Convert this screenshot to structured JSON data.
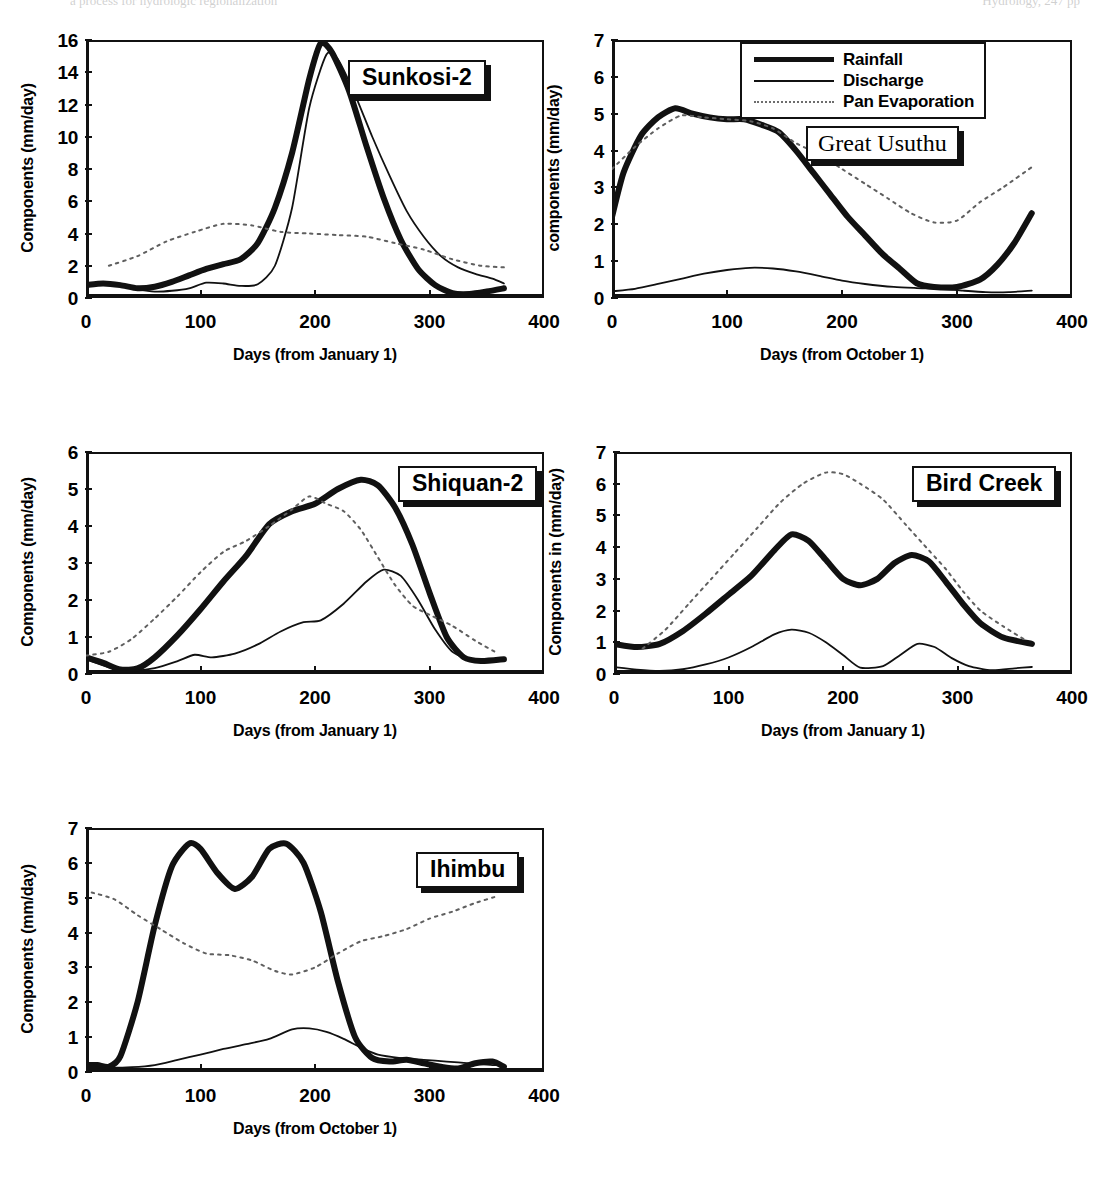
{
  "page": {
    "top_strip_left": "a process for hydrologic regionalization",
    "top_strip_right": "Hydrology, 247 pp"
  },
  "legend": {
    "position": "top-center-of-great-usuthu-panel",
    "entries": [
      {
        "label": "Rainfall",
        "style": "thick-solid",
        "color": "#111111"
      },
      {
        "label": "Discharge",
        "style": "thin-solid",
        "color": "#111111"
      },
      {
        "label": "Pan Evaporation",
        "style": "dotted",
        "color": "#6d6d6d"
      }
    ]
  },
  "chart_data": [
    {
      "id": "sunkosi-2",
      "type": "line",
      "title": "Sunkosi-2",
      "title_font": "sans",
      "xlabel": "Days (from January 1)",
      "ylabel": "Components (mm/day)",
      "xlim": [
        0,
        400
      ],
      "ylim": [
        0,
        16
      ],
      "xticks": [
        0,
        100,
        200,
        300,
        400
      ],
      "yticks": [
        0,
        2,
        4,
        6,
        8,
        10,
        12,
        14,
        16
      ],
      "grid": false,
      "series": [
        {
          "name": "Rainfall",
          "style": "thick-solid",
          "x": [
            0,
            15,
            30,
            45,
            60,
            75,
            90,
            105,
            120,
            135,
            150,
            165,
            180,
            195,
            205,
            215,
            230,
            245,
            260,
            275,
            290,
            305,
            320,
            335,
            350,
            365
          ],
          "y": [
            0.8,
            0.9,
            0.8,
            0.6,
            0.7,
            1.0,
            1.4,
            1.8,
            2.1,
            2.4,
            3.4,
            5.6,
            9.0,
            13.6,
            15.8,
            15.2,
            12.8,
            9.4,
            6.2,
            3.6,
            1.8,
            0.8,
            0.3,
            0.25,
            0.4,
            0.6
          ]
        },
        {
          "name": "Discharge",
          "style": "thin-solid",
          "x": [
            0,
            15,
            30,
            45,
            60,
            75,
            90,
            105,
            120,
            135,
            150,
            165,
            180,
            195,
            210,
            220,
            235,
            250,
            265,
            280,
            295,
            310,
            325,
            340,
            355,
            365
          ],
          "y": [
            0.7,
            0.85,
            0.8,
            0.55,
            0.4,
            0.45,
            0.6,
            0.95,
            0.9,
            0.75,
            0.85,
            2.0,
            5.6,
            11.8,
            15.1,
            14.8,
            12.6,
            10.0,
            7.6,
            5.4,
            3.8,
            2.6,
            1.9,
            1.5,
            1.2,
            0.9
          ]
        },
        {
          "name": "Pan Evaporation",
          "style": "dotted",
          "x": [
            20,
            45,
            70,
            95,
            120,
            145,
            170,
            195,
            220,
            245,
            270,
            295,
            320,
            345,
            365
          ],
          "y": [
            2.0,
            2.6,
            3.5,
            4.1,
            4.6,
            4.5,
            4.1,
            4.0,
            3.9,
            3.8,
            3.4,
            3.0,
            2.4,
            2.0,
            1.9
          ]
        }
      ]
    },
    {
      "id": "great-usuthu",
      "type": "line",
      "title": "Great Usuthu",
      "title_font": "serif",
      "xlabel": "Days (from October 1)",
      "ylabel": "components (mm/day)",
      "xlim": [
        0,
        400
      ],
      "ylim": [
        0,
        7
      ],
      "xticks": [
        0,
        100,
        200,
        300,
        400
      ],
      "yticks": [
        0,
        1,
        2,
        3,
        4,
        5,
        6,
        7
      ],
      "grid": false,
      "series": [
        {
          "name": "Rainfall",
          "style": "thick-solid",
          "x": [
            0,
            10,
            25,
            40,
            55,
            70,
            85,
            100,
            115,
            130,
            145,
            160,
            175,
            190,
            205,
            220,
            235,
            250,
            265,
            280,
            300,
            320,
            335,
            350,
            365
          ],
          "y": [
            2.2,
            3.4,
            4.4,
            4.9,
            5.15,
            5.0,
            4.9,
            4.85,
            4.85,
            4.7,
            4.5,
            4.0,
            3.4,
            2.8,
            2.2,
            1.7,
            1.2,
            0.8,
            0.4,
            0.3,
            0.3,
            0.5,
            0.9,
            1.5,
            2.3
          ]
        },
        {
          "name": "Discharge",
          "style": "thin-solid",
          "x": [
            0,
            20,
            40,
            60,
            80,
            100,
            120,
            140,
            160,
            180,
            200,
            220,
            245,
            265,
            285,
            305,
            325,
            345,
            365
          ],
          "y": [
            0.18,
            0.25,
            0.38,
            0.52,
            0.66,
            0.76,
            0.82,
            0.8,
            0.72,
            0.6,
            0.47,
            0.38,
            0.3,
            0.27,
            0.25,
            0.2,
            0.16,
            0.16,
            0.2
          ]
        },
        {
          "name": "Pan Evaporation",
          "style": "dotted",
          "x": [
            0,
            20,
            40,
            60,
            80,
            100,
            120,
            140,
            160,
            180,
            200,
            220,
            240,
            260,
            280,
            300,
            320,
            340,
            365
          ],
          "y": [
            3.5,
            4.1,
            4.6,
            4.95,
            4.9,
            4.85,
            4.8,
            4.6,
            4.2,
            3.9,
            3.5,
            3.1,
            2.7,
            2.3,
            2.05,
            2.1,
            2.6,
            3.0,
            3.55
          ]
        }
      ]
    },
    {
      "id": "shiquan-2",
      "type": "line",
      "title": "Shiquan-2",
      "title_font": "sans",
      "xlabel": "Days (from January 1)",
      "ylabel": "Components (mm/day)",
      "xlim": [
        0,
        400
      ],
      "ylim": [
        0,
        6
      ],
      "xticks": [
        0,
        100,
        200,
        300,
        400
      ],
      "yticks": [
        0,
        1,
        2,
        3,
        4,
        5,
        6
      ],
      "grid": false,
      "series": [
        {
          "name": "Rainfall",
          "style": "thick-solid",
          "x": [
            0,
            15,
            30,
            45,
            60,
            80,
            100,
            120,
            140,
            160,
            180,
            200,
            220,
            240,
            255,
            270,
            285,
            300,
            315,
            330,
            345,
            365
          ],
          "y": [
            0.45,
            0.3,
            0.12,
            0.15,
            0.45,
            1.05,
            1.75,
            2.5,
            3.2,
            4.05,
            4.4,
            4.6,
            5.0,
            5.25,
            5.1,
            4.5,
            3.5,
            2.2,
            1.0,
            0.45,
            0.35,
            0.4
          ]
        },
        {
          "name": "Discharge",
          "style": "thin-solid",
          "x": [
            0,
            20,
            40,
            60,
            80,
            95,
            110,
            130,
            150,
            170,
            190,
            205,
            225,
            245,
            260,
            275,
            290,
            305,
            320,
            340,
            365
          ],
          "y": [
            0.4,
            0.18,
            0.1,
            0.16,
            0.35,
            0.52,
            0.45,
            0.55,
            0.8,
            1.15,
            1.4,
            1.45,
            1.9,
            2.5,
            2.82,
            2.65,
            2.0,
            1.2,
            0.6,
            0.35,
            0.35
          ]
        },
        {
          "name": "Pan Evaporation",
          "style": "dotted",
          "x": [
            0,
            20,
            40,
            60,
            80,
            100,
            120,
            140,
            160,
            180,
            195,
            210,
            225,
            240,
            255,
            270,
            285,
            300,
            320,
            340,
            360
          ],
          "y": [
            0.5,
            0.6,
            0.95,
            1.5,
            2.1,
            2.75,
            3.3,
            3.6,
            4.0,
            4.45,
            4.8,
            4.6,
            4.4,
            3.9,
            3.15,
            2.4,
            1.85,
            1.6,
            1.3,
            0.9,
            0.55
          ]
        }
      ]
    },
    {
      "id": "bird-creek",
      "type": "line",
      "title": "Bird Creek",
      "title_font": "sans",
      "xlabel": "Days (from January 1)",
      "ylabel": "Components in (mm/day)",
      "xlim": [
        0,
        400
      ],
      "ylim": [
        0,
        7
      ],
      "xticks": [
        0,
        100,
        200,
        300,
        400
      ],
      "yticks": [
        0,
        1,
        2,
        3,
        4,
        5,
        6,
        7
      ],
      "grid": false,
      "series": [
        {
          "name": "Rainfall",
          "style": "thick-solid",
          "x": [
            0,
            20,
            40,
            60,
            80,
            100,
            120,
            140,
            155,
            170,
            185,
            200,
            215,
            230,
            245,
            260,
            275,
            290,
            305,
            320,
            340,
            365
          ],
          "y": [
            0.95,
            0.85,
            0.95,
            1.35,
            1.9,
            2.5,
            3.1,
            3.9,
            4.4,
            4.2,
            3.6,
            3.0,
            2.8,
            3.0,
            3.5,
            3.75,
            3.55,
            2.9,
            2.2,
            1.6,
            1.15,
            0.95
          ]
        },
        {
          "name": "Discharge",
          "style": "thin-solid",
          "x": [
            0,
            20,
            40,
            60,
            80,
            100,
            120,
            140,
            155,
            170,
            185,
            200,
            215,
            235,
            250,
            265,
            280,
            295,
            310,
            330,
            350,
            365
          ],
          "y": [
            0.22,
            0.14,
            0.1,
            0.15,
            0.3,
            0.52,
            0.85,
            1.25,
            1.4,
            1.3,
            1.0,
            0.6,
            0.2,
            0.25,
            0.6,
            0.95,
            0.85,
            0.5,
            0.25,
            0.12,
            0.18,
            0.22
          ]
        },
        {
          "name": "Pan Evaporation",
          "style": "dotted",
          "x": [
            25,
            45,
            65,
            85,
            105,
            125,
            145,
            165,
            185,
            200,
            215,
            235,
            255,
            275,
            290,
            305,
            320,
            340,
            360
          ],
          "y": [
            0.8,
            1.4,
            2.2,
            3.0,
            3.8,
            4.6,
            5.4,
            6.0,
            6.35,
            6.3,
            6.0,
            5.5,
            4.7,
            3.9,
            3.3,
            2.6,
            2.0,
            1.5,
            1.05
          ]
        }
      ]
    },
    {
      "id": "ihimbu",
      "type": "line",
      "title": "Ihimbu",
      "title_font": "sans",
      "xlabel": "Days (from October 1)",
      "ylabel": "Components (mm/day)",
      "xlim": [
        0,
        400
      ],
      "ylim": [
        0,
        7
      ],
      "xticks": [
        0,
        100,
        200,
        300,
        400
      ],
      "yticks": [
        0,
        1,
        2,
        3,
        4,
        5,
        6,
        7
      ],
      "grid": false,
      "series": [
        {
          "name": "Rainfall",
          "style": "thick-solid",
          "x": [
            0,
            10,
            20,
            30,
            45,
            60,
            75,
            90,
            100,
            115,
            130,
            145,
            160,
            175,
            190,
            205,
            220,
            235,
            250,
            265,
            280,
            295,
            310,
            325,
            340,
            355,
            365
          ],
          "y": [
            0.2,
            0.2,
            0.15,
            0.45,
            2.0,
            4.2,
            5.9,
            6.55,
            6.4,
            5.7,
            5.25,
            5.6,
            6.4,
            6.55,
            6.0,
            4.6,
            2.6,
            1.0,
            0.4,
            0.3,
            0.35,
            0.25,
            0.15,
            0.1,
            0.25,
            0.3,
            0.15
          ]
        },
        {
          "name": "Discharge",
          "style": "thin-solid",
          "x": [
            0,
            20,
            40,
            60,
            80,
            100,
            120,
            140,
            160,
            180,
            195,
            210,
            225,
            240,
            255,
            275,
            295,
            315,
            335,
            355,
            365
          ],
          "y": [
            0.25,
            0.13,
            0.14,
            0.2,
            0.35,
            0.5,
            0.66,
            0.8,
            0.95,
            1.22,
            1.25,
            1.15,
            0.95,
            0.7,
            0.5,
            0.4,
            0.35,
            0.3,
            0.25,
            0.2,
            0.2
          ]
        },
        {
          "name": "Pan Evaporation",
          "style": "dotted",
          "x": [
            5,
            25,
            45,
            65,
            85,
            105,
            125,
            145,
            165,
            180,
            200,
            220,
            240,
            260,
            280,
            300,
            320,
            340,
            360
          ],
          "y": [
            5.15,
            4.95,
            4.5,
            4.1,
            3.7,
            3.4,
            3.35,
            3.2,
            2.9,
            2.8,
            3.0,
            3.4,
            3.75,
            3.9,
            4.1,
            4.4,
            4.6,
            4.85,
            5.05
          ]
        }
      ]
    }
  ]
}
